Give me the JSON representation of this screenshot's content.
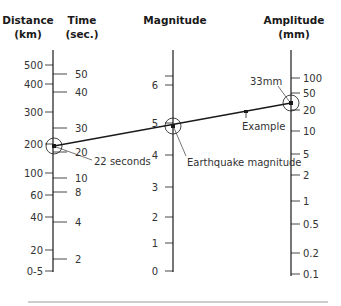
{
  "headers": {
    "distance": [
      "Distance",
      "(km)"
    ],
    "time": [
      "Time",
      "(sec.)"
    ],
    "magnitude": [
      "Magnitude"
    ],
    "amplitude": [
      "Amplitude",
      "(mm)"
    ]
  },
  "axes": {
    "distance": {
      "x": 53,
      "y_top": 50,
      "y_bottom": 272,
      "ticks": [
        {
          "label": "500",
          "y": 65
        },
        {
          "label": "400",
          "y": 84
        },
        {
          "label": "300",
          "y": 112
        },
        {
          "label": "200",
          "y": 144
        },
        {
          "label": "100",
          "y": 173
        },
        {
          "label": "60",
          "y": 195
        },
        {
          "label": "40",
          "y": 217
        },
        {
          "label": "20",
          "y": 250
        },
        {
          "label": "0-5",
          "y": 271
        }
      ]
    },
    "time": {
      "ticks": [
        {
          "label": "50",
          "y": 74
        },
        {
          "label": "40",
          "y": 92
        },
        {
          "label": "30",
          "y": 128
        },
        {
          "label": "20",
          "y": 152
        },
        {
          "label": "10",
          "y": 178
        },
        {
          "label": "8",
          "y": 192
        },
        {
          "label": "4",
          "y": 222
        },
        {
          "label": "2",
          "y": 259
        }
      ]
    },
    "magnitude": {
      "x": 173,
      "y_top": 50,
      "y_bottom": 272,
      "minor_ticks": [
        76
      ],
      "ticks": [
        {
          "label": "6",
          "y": 85
        },
        {
          "label": "5",
          "y": 123
        },
        {
          "label": "4",
          "y": 155
        },
        {
          "label": "3",
          "y": 187
        },
        {
          "label": "2",
          "y": 217
        },
        {
          "label": "1",
          "y": 243
        },
        {
          "label": "0",
          "y": 271
        }
      ]
    },
    "amplitude": {
      "x": 291,
      "y_top": 50,
      "y_bottom": 276,
      "ticks": [
        {
          "label": "100",
          "y": 78
        },
        {
          "label": "50",
          "y": 93
        },
        {
          "label": "20",
          "y": 110
        },
        {
          "label": "10",
          "y": 131
        },
        {
          "label": "5",
          "y": 154
        },
        {
          "label": "2",
          "y": 175
        },
        {
          "label": "1",
          "y": 201
        },
        {
          "label": "0.5",
          "y": 224
        },
        {
          "label": "0.2",
          "y": 253
        },
        {
          "label": "0.1",
          "y": 274
        }
      ]
    }
  },
  "example": {
    "distance_point": {
      "x": 54,
      "y": 146
    },
    "magnitude_point": {
      "x": 173,
      "y": 126
    },
    "amplitude_point": {
      "x": 291,
      "y": 103
    },
    "example_marker": {
      "x": 246,
      "y": 112
    },
    "annotations": {
      "time": "22 seconds",
      "magnitude": "Earthquake magnitude",
      "amplitude": "33mm",
      "example": "Example"
    }
  },
  "colors": {
    "line": "#1a1a1a",
    "text": "#333333",
    "rule": "#9a9a9a"
  }
}
